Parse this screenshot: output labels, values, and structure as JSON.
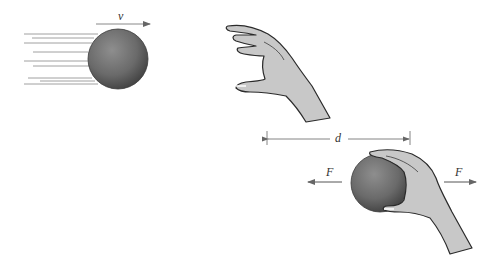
{
  "diagram": {
    "moving_ball": {
      "velocity_label": "v",
      "speed_lines_y": [
        34,
        38,
        43,
        52,
        61,
        66,
        78,
        81,
        84
      ]
    },
    "catch": {
      "distance_label": "d",
      "force_left_label": "F",
      "force_right_label": "F"
    },
    "colors": {
      "ball_dark": "#4f4f4f",
      "ball_light": "#8c8c8c",
      "hand_fill": "#c9c9c9",
      "hand_stroke": "#2a2a2a",
      "arrow": "#555555",
      "lines": "#9a9a9a"
    }
  }
}
